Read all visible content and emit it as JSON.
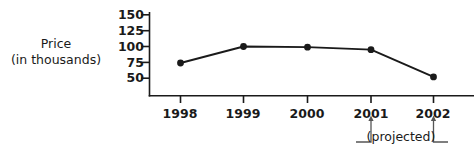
{
  "chart_data": {
    "type": "line",
    "title": "",
    "subtitle": "",
    "xlabel": "",
    "ylabel": "Price (in thousands)",
    "ylabel_lines": [
      "Price",
      "(in thousands)"
    ],
    "categories": [
      "1998",
      "1999",
      "2000",
      "2001",
      "2002"
    ],
    "x": [
      1998,
      1999,
      2000,
      2001,
      2002
    ],
    "values": [
      74,
      100,
      99,
      95,
      52
    ],
    "series": [
      {
        "name": "Price",
        "values": [
          74,
          100,
          99,
          95,
          52
        ]
      }
    ],
    "ylim": [
      25,
      150
    ],
    "yticks": [
      150,
      125,
      100,
      75,
      50
    ],
    "ytick_labels": [
      "150",
      "125",
      "100",
      "75",
      "50"
    ],
    "xtick_labels": [
      "1998",
      "1999",
      "2000",
      "2001",
      "2002"
    ],
    "grid": false,
    "legend": false,
    "legend_position": "none",
    "markers": "filled-circle",
    "annotations": [
      {
        "text": "(projected)",
        "type": "bracket-with-arrows",
        "applies_to": [
          "2001",
          "2002"
        ]
      }
    ],
    "colors": {
      "line": "#1a1a1a",
      "marker": "#1a1a1a",
      "axis": "#1a1a1a",
      "text": "#1a1a1a",
      "background": "#ffffff"
    }
  },
  "annotation": {
    "projected_label": "(projected)"
  }
}
